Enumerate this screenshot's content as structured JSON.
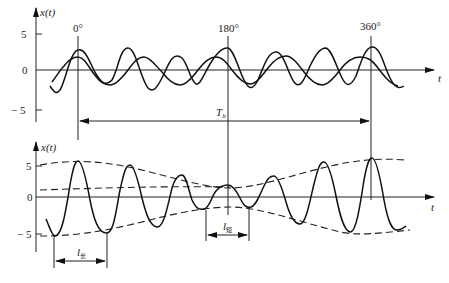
{
  "top_plot": {
    "y_label": "x(t)",
    "x_label": "t",
    "y_ticks": [
      "5",
      "0",
      "− 5"
    ],
    "markers": [
      "0°",
      "180°",
      "360°"
    ],
    "period_label": "T",
    "period_subscript": "b"
  },
  "bottom_plot": {
    "y_label": "x(t)",
    "x_label": "t",
    "y_ticks": [
      "5",
      "0",
      "− 5"
    ],
    "long_label": "l",
    "long_subscript": "长",
    "short_label": "l",
    "short_subscript": "短"
  }
}
